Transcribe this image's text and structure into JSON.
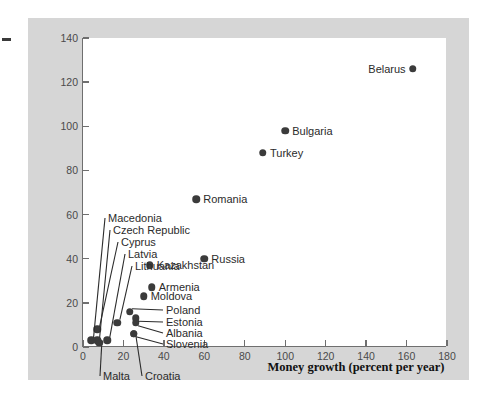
{
  "axes": {
    "x_title": "Money growth (percent per year)",
    "y_title_line1": "Inflation rate",
    "y_title_line2": "(percent per year)",
    "x_ticks": [
      "0",
      "20",
      "40",
      "60",
      "80",
      "100",
      "120",
      "140",
      "160",
      "180"
    ],
    "y_ticks": [
      "0",
      "20",
      "40",
      "60",
      "80",
      "100",
      "120",
      "140"
    ]
  },
  "chart_data": {
    "type": "scatter",
    "title": "",
    "xlabel": "Money growth (percent per year)",
    "ylabel": "Inflation rate (percent per year)",
    "xlim": [
      0,
      180
    ],
    "ylim": [
      0,
      140
    ],
    "xticks": [
      0,
      20,
      40,
      60,
      80,
      100,
      120,
      140,
      160,
      180
    ],
    "yticks": [
      0,
      20,
      40,
      60,
      80,
      100,
      120,
      140
    ],
    "grid": false,
    "legend": "none",
    "marker_color": "#3b3b3b",
    "points": [
      {
        "name": "Belarus",
        "x": 163,
        "y": 126,
        "label_side": "left"
      },
      {
        "name": "Bulgaria",
        "x": 100,
        "y": 98,
        "label_side": "right"
      },
      {
        "name": "Turkey",
        "x": 89,
        "y": 88,
        "label_side": "right"
      },
      {
        "name": "Romania",
        "x": 56,
        "y": 67,
        "label_side": "right"
      },
      {
        "name": "Russia",
        "x": 60,
        "y": 40,
        "label_side": "right"
      },
      {
        "name": "Kazakhstan",
        "x": 33,
        "y": 37,
        "label_side": "right"
      },
      {
        "name": "Armenia",
        "x": 34,
        "y": 27,
        "label_side": "right"
      },
      {
        "name": "Moldova",
        "x": 30,
        "y": 23,
        "label_side": "right"
      },
      {
        "name": "Poland",
        "x": 23,
        "y": 16,
        "label_side": "leader"
      },
      {
        "name": "Estonia",
        "x": 26,
        "y": 13,
        "label_side": "leader"
      },
      {
        "name": "Albania",
        "x": 26,
        "y": 11,
        "label_side": "leader"
      },
      {
        "name": "Slovenia",
        "x": 25,
        "y": 6,
        "label_side": "leader"
      },
      {
        "name": "Macedonia",
        "x": 4,
        "y": 3,
        "label_side": "leader"
      },
      {
        "name": "Czech Republic",
        "x": 7,
        "y": 3,
        "label_side": "leader"
      },
      {
        "name": "Cyprus",
        "x": 7,
        "y": 8,
        "label_side": "leader"
      },
      {
        "name": "Latvia",
        "x": 12,
        "y": 3,
        "label_side": "leader"
      },
      {
        "name": "Lithuania",
        "x": 17,
        "y": 11,
        "label_side": "leader"
      },
      {
        "name": "Malta",
        "x": 8,
        "y": 2,
        "label_side": "leader-below"
      },
      {
        "name": "Croatia",
        "x": 25,
        "y": 6,
        "label_side": "leader-below"
      }
    ],
    "leader_labels": [
      {
        "text": "Macedonia",
        "lx": 108,
        "ly": 218
      },
      {
        "text": "Czech Republic",
        "lx": 113,
        "ly": 230
      },
      {
        "text": "Cyprus",
        "lx": 121,
        "ly": 242
      },
      {
        "text": "Latvia",
        "lx": 128,
        "ly": 254
      },
      {
        "text": "Lithuania",
        "lx": 135,
        "ly": 266
      },
      {
        "text": "Poland",
        "lx": 166,
        "ly": 310
      },
      {
        "text": "Estonia",
        "lx": 166,
        "ly": 322
      },
      {
        "text": "Albania",
        "lx": 166,
        "ly": 333
      },
      {
        "text": "Slovenia",
        "lx": 166,
        "ly": 344
      },
      {
        "text": "Malta",
        "lx": 103,
        "ly": 376
      },
      {
        "text": "Croatia",
        "lx": 145,
        "ly": 376
      }
    ]
  }
}
